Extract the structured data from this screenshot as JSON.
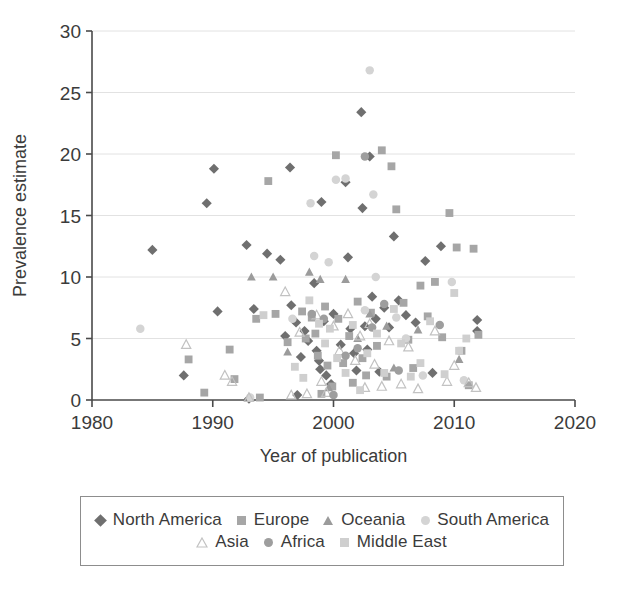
{
  "chart_data": {
    "type": "scatter",
    "title": "",
    "xlabel": "Year of publication",
    "ylabel": "Prevalence estimate",
    "xlim": [
      1980,
      2020
    ],
    "ylim": [
      0,
      30
    ],
    "xticks": [
      1980,
      1990,
      2000,
      2010,
      2020
    ],
    "yticks": [
      0,
      5,
      10,
      15,
      20,
      25,
      30
    ],
    "grid": "horizontal",
    "legend_position": "bottom",
    "series": [
      {
        "name": "North America",
        "marker": "diamond",
        "color": "#6f6f6f",
        "points": [
          [
            1985.0,
            12.2
          ],
          [
            1987.6,
            2.0
          ],
          [
            1989.5,
            16.0
          ],
          [
            1990.1,
            18.8
          ],
          [
            1990.4,
            7.2
          ],
          [
            1992.8,
            12.6
          ],
          [
            1993.0,
            0.1
          ],
          [
            1993.4,
            7.4
          ],
          [
            1994.5,
            11.9
          ],
          [
            1995.6,
            11.4
          ],
          [
            1996.0,
            5.2
          ],
          [
            1996.4,
            18.9
          ],
          [
            1996.5,
            7.7
          ],
          [
            1996.9,
            6.3
          ],
          [
            1997.0,
            0.4
          ],
          [
            1997.3,
            3.5
          ],
          [
            1997.6,
            5.6
          ],
          [
            1997.9,
            4.8
          ],
          [
            1998.4,
            9.5
          ],
          [
            1998.6,
            4.0
          ],
          [
            1998.8,
            3.2
          ],
          [
            1998.9,
            2.5
          ],
          [
            1999.0,
            16.1
          ],
          [
            1999.2,
            6.4
          ],
          [
            1999.4,
            2.0
          ],
          [
            1999.8,
            1.3
          ],
          [
            2000.0,
            7.0
          ],
          [
            2000.6,
            4.5
          ],
          [
            2001.0,
            17.7
          ],
          [
            2001.2,
            11.6
          ],
          [
            2001.4,
            5.8
          ],
          [
            2001.7,
            3.8
          ],
          [
            2001.9,
            2.4
          ],
          [
            2002.3,
            23.4
          ],
          [
            2002.4,
            15.6
          ],
          [
            2002.6,
            6.0
          ],
          [
            2002.8,
            4.1
          ],
          [
            2003.0,
            19.8
          ],
          [
            2003.2,
            8.4
          ],
          [
            2003.5,
            6.6
          ],
          [
            2003.8,
            2.3
          ],
          [
            2004.2,
            7.5
          ],
          [
            2004.6,
            5.9
          ],
          [
            2005.0,
            13.3
          ],
          [
            2005.4,
            8.1
          ],
          [
            2006.0,
            6.9
          ],
          [
            2006.8,
            6.3
          ],
          [
            2007.6,
            11.3
          ],
          [
            2008.2,
            2.2
          ],
          [
            2008.9,
            12.5
          ],
          [
            2011.9,
            6.5
          ],
          [
            2011.9,
            5.6
          ]
        ]
      },
      {
        "name": "Europe",
        "marker": "square",
        "color": "#a6a6a6",
        "points": [
          [
            1988.0,
            3.3
          ],
          [
            1989.3,
            0.6
          ],
          [
            1991.4,
            4.1
          ],
          [
            1991.8,
            1.7
          ],
          [
            1993.6,
            6.6
          ],
          [
            1993.9,
            0.2
          ],
          [
            1994.6,
            17.8
          ],
          [
            1995.2,
            7.0
          ],
          [
            1996.2,
            4.7
          ],
          [
            1997.4,
            7.2
          ],
          [
            1997.7,
            5.0
          ],
          [
            1998.2,
            6.7
          ],
          [
            1998.5,
            5.4
          ],
          [
            1998.7,
            3.6
          ],
          [
            1999.0,
            0.5
          ],
          [
            1999.3,
            7.6
          ],
          [
            1999.5,
            2.8
          ],
          [
            1999.9,
            1.1
          ],
          [
            2000.2,
            19.9
          ],
          [
            2000.4,
            6.6
          ],
          [
            2000.8,
            3.0
          ],
          [
            2001.3,
            5.2
          ],
          [
            2001.6,
            1.4
          ],
          [
            2002.0,
            8.0
          ],
          [
            2002.4,
            3.4
          ],
          [
            2002.7,
            2.0
          ],
          [
            2003.1,
            7.1
          ],
          [
            2003.6,
            4.4
          ],
          [
            2004.0,
            20.3
          ],
          [
            2004.4,
            1.9
          ],
          [
            2004.8,
            19.0
          ],
          [
            2005.2,
            15.5
          ],
          [
            2005.8,
            7.9
          ],
          [
            2006.2,
            4.9
          ],
          [
            2006.6,
            2.6
          ],
          [
            2007.2,
            9.3
          ],
          [
            2007.8,
            6.8
          ],
          [
            2008.4,
            9.6
          ],
          [
            2009.0,
            5.1
          ],
          [
            2009.6,
            15.2
          ],
          [
            2010.2,
            12.4
          ],
          [
            2010.6,
            4.0
          ],
          [
            2011.2,
            1.2
          ],
          [
            2011.6,
            12.3
          ],
          [
            2012.0,
            5.3
          ]
        ]
      },
      {
        "name": "Oceania",
        "marker": "triangle",
        "color": "#9b9b9b",
        "points": [
          [
            1993.2,
            10.0
          ],
          [
            1995.0,
            10.0
          ],
          [
            1996.2,
            3.9
          ],
          [
            1998.0,
            10.4
          ],
          [
            1998.9,
            9.8
          ],
          [
            1999.6,
            1.0
          ],
          [
            2001.0,
            9.8
          ],
          [
            2002.0,
            5.0
          ],
          [
            2003.0,
            7.0
          ],
          [
            2004.4,
            6.0
          ],
          [
            2005.0,
            2.6
          ],
          [
            2007.0,
            5.7
          ],
          [
            2010.4,
            3.3
          ]
        ]
      },
      {
        "name": "South America",
        "marker": "circle-light",
        "color": "#d4d4d4",
        "points": [
          [
            1984.0,
            5.8
          ],
          [
            1993.1,
            0.2
          ],
          [
            1996.6,
            6.6
          ],
          [
            1998.1,
            16.0
          ],
          [
            1998.4,
            11.7
          ],
          [
            1999.6,
            11.2
          ],
          [
            2000.2,
            17.9
          ],
          [
            2001.0,
            18.0
          ],
          [
            2002.6,
            7.3
          ],
          [
            2003.0,
            26.8
          ],
          [
            2003.3,
            16.7
          ],
          [
            2003.5,
            10.0
          ],
          [
            2005.2,
            6.7
          ],
          [
            2006.0,
            5.0
          ],
          [
            2007.4,
            2.0
          ],
          [
            2009.8,
            9.6
          ],
          [
            2010.8,
            1.6
          ]
        ]
      },
      {
        "name": "Asia",
        "marker": "triangle-open",
        "color": "#c2c2c2",
        "points": [
          [
            1987.8,
            4.5
          ],
          [
            1991.0,
            2.0
          ],
          [
            1991.6,
            1.5
          ],
          [
            1993.0,
            0.2
          ],
          [
            1996.0,
            8.8
          ],
          [
            1996.5,
            0.4
          ],
          [
            1997.2,
            5.5
          ],
          [
            1997.8,
            0.5
          ],
          [
            1998.6,
            6.9
          ],
          [
            1999.0,
            1.5
          ],
          [
            1999.4,
            0.6
          ],
          [
            2000.0,
            6.0
          ],
          [
            2000.5,
            4.0
          ],
          [
            2001.2,
            7.0
          ],
          [
            2001.8,
            3.2
          ],
          [
            2002.2,
            5.2
          ],
          [
            2002.6,
            1.0
          ],
          [
            2003.0,
            6.2
          ],
          [
            2003.4,
            2.9
          ],
          [
            2004.0,
            1.1
          ],
          [
            2004.6,
            4.8
          ],
          [
            2005.6,
            1.3
          ],
          [
            2006.2,
            4.3
          ],
          [
            2007.0,
            0.9
          ],
          [
            2008.4,
            5.6
          ],
          [
            2009.4,
            1.5
          ],
          [
            2010.0,
            2.8
          ],
          [
            2011.2,
            1.4
          ],
          [
            2011.8,
            1.0
          ]
        ]
      },
      {
        "name": "Africa",
        "marker": "circle",
        "color": "#9e9e9e",
        "points": [
          [
            1998.2,
            7.0
          ],
          [
            1999.2,
            6.6
          ],
          [
            2000.0,
            0.4
          ],
          [
            2001.0,
            3.6
          ],
          [
            2002.0,
            4.2
          ],
          [
            2002.6,
            19.8
          ],
          [
            2003.2,
            5.9
          ],
          [
            2004.2,
            7.8
          ],
          [
            2005.4,
            2.4
          ],
          [
            2008.8,
            6.1
          ]
        ]
      },
      {
        "name": "Middle East",
        "marker": "square-light",
        "color": "#cfcfcf",
        "points": [
          [
            1994.2,
            6.9
          ],
          [
            1996.8,
            2.7
          ],
          [
            1997.5,
            1.8
          ],
          [
            1998.0,
            8.1
          ],
          [
            1998.8,
            6.2
          ],
          [
            1999.3,
            4.6
          ],
          [
            1999.7,
            5.8
          ],
          [
            2000.3,
            3.4
          ],
          [
            2001.0,
            2.2
          ],
          [
            2001.6,
            6.1
          ],
          [
            2002.2,
            0.8
          ],
          [
            2002.8,
            3.8
          ],
          [
            2003.6,
            5.4
          ],
          [
            2004.2,
            2.2
          ],
          [
            2005.0,
            7.4
          ],
          [
            2005.6,
            4.6
          ],
          [
            2006.4,
            1.9
          ],
          [
            2007.2,
            3.0
          ],
          [
            2008.0,
            6.4
          ],
          [
            2009.2,
            2.1
          ],
          [
            2010.0,
            8.7
          ],
          [
            2010.4,
            4.0
          ],
          [
            2011.0,
            5.0
          ]
        ]
      }
    ]
  },
  "axis": {
    "ylabel": "Prevalence estimate",
    "xlabel": "Year of publication",
    "ytick_labels": [
      "0",
      "5",
      "10",
      "15",
      "20",
      "25",
      "30"
    ],
    "xtick_labels": [
      "1980",
      "1990",
      "2000",
      "2010",
      "2020"
    ]
  },
  "legend": {
    "row1": [
      {
        "label": "North America",
        "marker": "diamond",
        "color": "#6f6f6f"
      },
      {
        "label": "Europe",
        "marker": "square",
        "color": "#a6a6a6"
      },
      {
        "label": "Oceania",
        "marker": "triangle",
        "color": "#9b9b9b"
      },
      {
        "label": "South America",
        "marker": "circle-light",
        "color": "#d4d4d4"
      }
    ],
    "row2": [
      {
        "label": "Asia",
        "marker": "triangle-open",
        "color": "#c2c2c2"
      },
      {
        "label": "Africa",
        "marker": "circle",
        "color": "#9e9e9e"
      },
      {
        "label": "Middle East",
        "marker": "square-light",
        "color": "#cfcfcf"
      }
    ]
  },
  "colors": {
    "axis": "#4a4a4a",
    "grid": "#e2e2e2",
    "text": "#3b3b3b",
    "legend_border": "#8d8d8d"
  }
}
